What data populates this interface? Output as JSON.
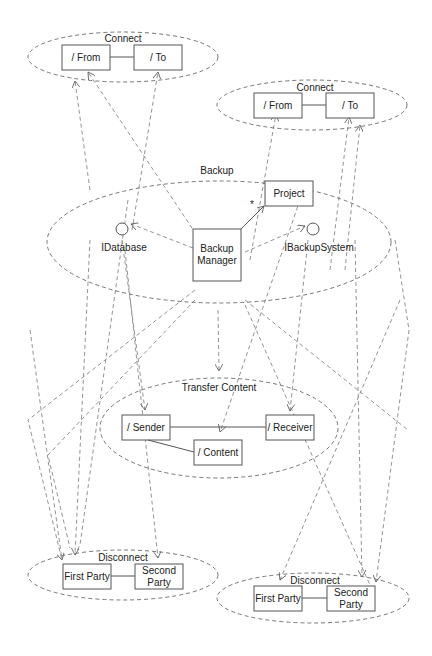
{
  "diagram": {
    "type": "UML collaboration diagram",
    "collaborations": {
      "connect_left": {
        "label": "Connect",
        "roles": [
          "/ From",
          "/ To"
        ]
      },
      "connect_right": {
        "label": "Connect",
        "roles": [
          "/ From",
          "/ To"
        ]
      },
      "backup": {
        "label": "Backup",
        "parts": [
          "Backup\nManager",
          "Project"
        ],
        "backup_manager_line1": "Backup",
        "backup_manager_line2": "Manager",
        "project": "Project",
        "multiplicity": "*",
        "interfaces": [
          "IDatabase",
          "IBackupSystem"
        ]
      },
      "transfer_content": {
        "label": "Transfer Content",
        "roles": [
          "/ Sender",
          "/ Receiver",
          "/ Content"
        ]
      },
      "disconnect_left": {
        "label": "Disconnect",
        "roles": [
          "First Party",
          "Second Party"
        ],
        "second_line1": "Second",
        "second_line2": "Party"
      },
      "disconnect_right": {
        "label": "Disconnect",
        "roles": [
          "First Party",
          "Second Party"
        ],
        "second_line1": "Second",
        "second_line2": "Party"
      }
    },
    "colors": {
      "stroke": "#555555",
      "dashed": "#777777",
      "background": "#ffffff"
    }
  }
}
